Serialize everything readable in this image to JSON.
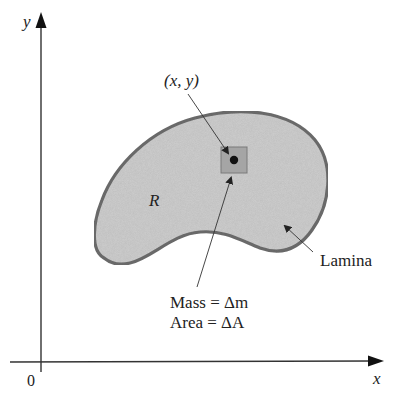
{
  "figure": {
    "axes": {
      "x_label": "x",
      "y_label": "y",
      "origin_label": "0"
    },
    "region_label": "R",
    "point_label": "(x, y)",
    "lamina_label": "Lamina",
    "element_labels": {
      "mass": "Mass = Δm",
      "area": "Area = ΔA"
    },
    "colors": {
      "region_fill": "#cfcfcf",
      "region_outline": "#6e6e6e",
      "element_fill": "#a5a5a5",
      "axis": "#333333",
      "text": "#222222"
    }
  }
}
